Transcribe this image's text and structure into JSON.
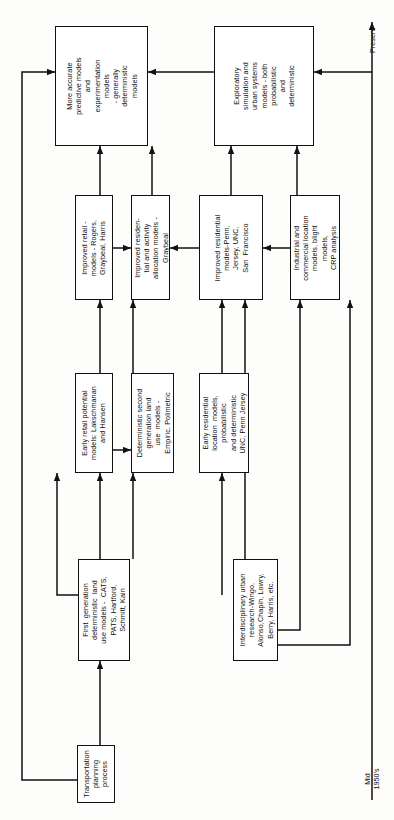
{
  "diagram": {
    "orientation": "rotated-90-ccw",
    "stroke_color": "#111111",
    "box_fill": "#ffffff",
    "page_background": "#fdfdfc",
    "nodes": [
      {
        "id": "more-accurate",
        "text": "More accurate\npredictive models\nand\nexperimentation\nmodels\n- generally\ndeterministic\nmodels"
      },
      {
        "id": "exploratory-simulation",
        "text": "Exploratory\nsimulation and\nurban systems\nmodels - both\nprobabilistic\nand\ndeterministic"
      },
      {
        "id": "improved-retail",
        "text": "Improved retail -\nmodels - Rogers,\nGraybeal, Harris"
      },
      {
        "id": "improved-residential-activity",
        "text": "Improved residen-\ntial and activity\nallocation models -\nGraybeal"
      },
      {
        "id": "improved-residential",
        "text": "Improved residential\nmodels-Penn,\nJersey, UNC,\nSan  Francisco"
      },
      {
        "id": "industrial-commercial",
        "text": "Industrial and\ncommercial location\nmodels, blight\nmodels,\nCRP analysis"
      },
      {
        "id": "early-retail-potential",
        "text": "Early retail potential\nmodels: Lakschmanan\nand Hansen"
      },
      {
        "id": "deterministic-second-gen",
        "text": "Deterministic second\ngeneration land\nuse  models -\nEmpiric, Polimetric"
      },
      {
        "id": "early-residential-location",
        "text": "Early residential\nlocation  models,\nprobabilistic\nand deterministic\nUNC, Penn Jersey"
      },
      {
        "id": "first-generation",
        "text": "First  generation\ndeterministic  land\nuse models -  CATS,\nPATS, Hartford,\nSchmitt, Kain"
      },
      {
        "id": "interdisciplinary-urban",
        "text": "Interdisciplinary urban\nresearch-Wingo,\nAlonso,Chapin, Lowry,\nBerry, Harris, etc."
      },
      {
        "id": "transportation-planning",
        "text": "Transportation\nplanning\nprocess"
      }
    ],
    "axis": {
      "start_label": "Mid\n1950's",
      "end_label": "Present"
    }
  }
}
